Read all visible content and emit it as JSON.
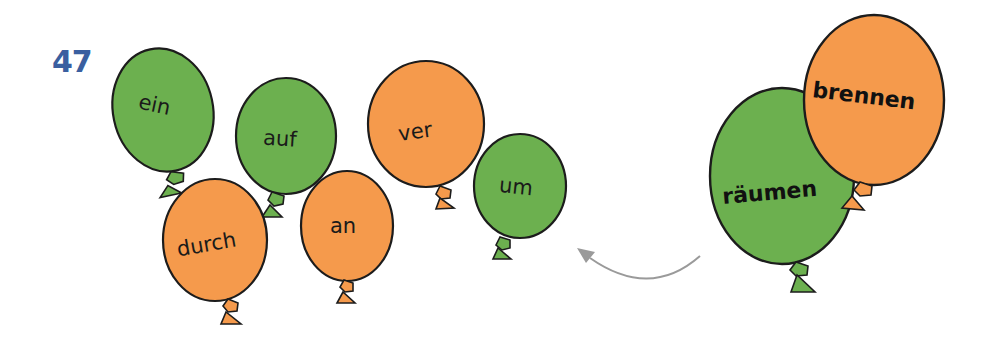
{
  "task": {
    "number": "47"
  },
  "colors": {
    "green": "#6cb04f",
    "orange": "#f59a4c",
    "outline": "#1c1c1c",
    "arrow": "#9a9a9a",
    "number": "#3a5fa0"
  },
  "prefix_balloons": [
    {
      "word": "ein",
      "color": "green"
    },
    {
      "word": "auf",
      "color": "green"
    },
    {
      "word": "durch",
      "color": "orange"
    },
    {
      "word": "an",
      "color": "orange"
    },
    {
      "word": "ver",
      "color": "orange"
    },
    {
      "word": "um",
      "color": "green"
    }
  ],
  "verb_balloons": [
    {
      "word": "räumen",
      "color": "green"
    },
    {
      "word": "brennen",
      "color": "orange"
    }
  ]
}
